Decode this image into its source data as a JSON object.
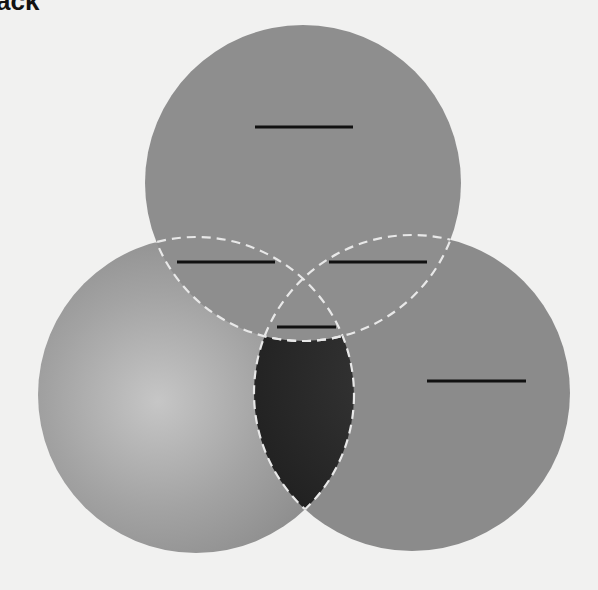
{
  "title_fragment": "ack",
  "diagram": {
    "type": "venn-3",
    "circles": [
      {
        "id": "top",
        "cx": 303,
        "cy": 183,
        "r": 158,
        "fill": "#8e8e8e",
        "label": ""
      },
      {
        "id": "left",
        "cx": 196,
        "cy": 395,
        "r": 158,
        "fill": "#8c8c8c",
        "label": ""
      },
      {
        "id": "right",
        "cx": 412,
        "cy": 393,
        "r": 158,
        "fill": "#8b8b8b",
        "label": ""
      }
    ],
    "highlighted_region": {
      "description": "left ∩ right, excluding top",
      "fill": "#2a2a2a"
    },
    "label_blanks": [
      {
        "region": "top-only",
        "x1": 255,
        "x2": 353,
        "y": 127
      },
      {
        "region": "top-left",
        "x1": 177,
        "x2": 275,
        "y": 262
      },
      {
        "region": "top-right",
        "x1": 329,
        "x2": 427,
        "y": 262
      },
      {
        "region": "all-three",
        "x1": 277,
        "x2": 336,
        "y": 327
      },
      {
        "region": "right-only",
        "x1": 427,
        "x2": 526,
        "y": 381
      }
    ],
    "outline_color": "#e8e8e8",
    "blank_color": "#111111"
  }
}
